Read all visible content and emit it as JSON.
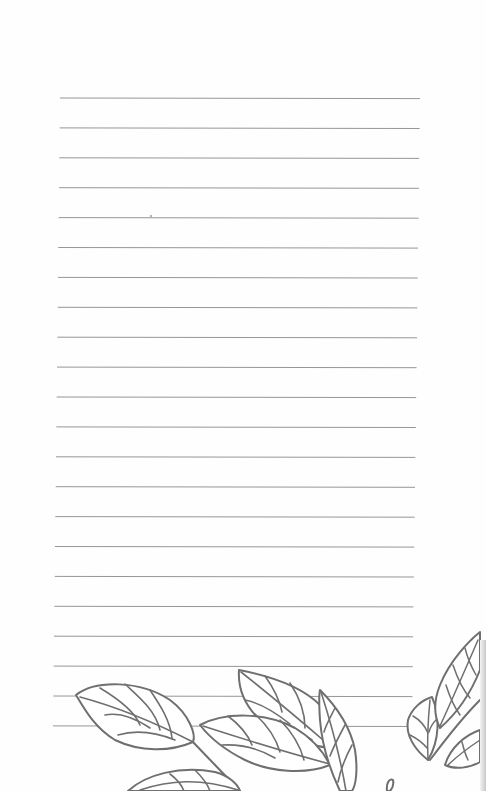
{
  "page": {
    "type": "lined-notebook-page",
    "background_color": "#fefefe",
    "line_color": "#8a8a8a",
    "illustration_stroke_color": "#6f6f6f",
    "illustration": "leaf-branches-bottom"
  },
  "ruled_lines": {
    "count": 22,
    "first_y": 98,
    "spacing": 29.9,
    "x_start": 60,
    "x_end_top": 420,
    "x_end_bottom": 412
  }
}
